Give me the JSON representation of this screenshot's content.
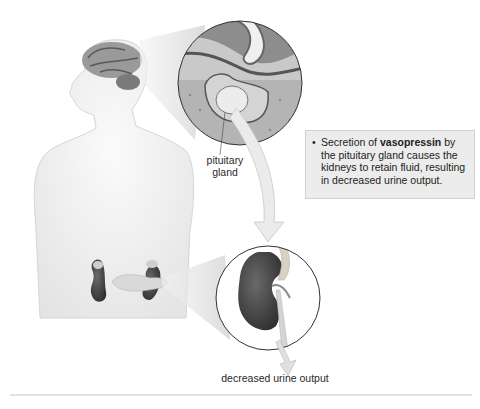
{
  "diagram": {
    "labels": {
      "pituitary": "pituitary\ngland",
      "pituitary_line1": "pituitary",
      "pituitary_line2": "gland",
      "output": "decreased urine output"
    },
    "callout": {
      "bullet": "•",
      "prefix": "Secretion of ",
      "bold": "vasopressin",
      "suffix": " by the pituitary gland causes the kidneys to retain fluid, resulting in decreased urine output."
    },
    "elements": [
      {
        "name": "human-silhouette",
        "description": "light gray upper-body figure facing left"
      },
      {
        "name": "brain",
        "description": "gray brain shown in head"
      },
      {
        "name": "pituitary-magnified-view",
        "description": "circular inset showing pituitary gland"
      },
      {
        "name": "kidneys",
        "description": "pair of dark kidneys with adrenal glands and pancreas"
      },
      {
        "name": "kidney-magnified-view",
        "description": "circular inset showing kidney with ureter"
      },
      {
        "name": "arrow-pituitary-to-kidney",
        "description": "curved light gray arrow"
      },
      {
        "name": "arrow-urine-output",
        "description": "small downward arrow from ureter"
      }
    ],
    "colors": {
      "background": "#ffffff",
      "body": "#f1f1f1",
      "organ_dark": "#4a4a4a",
      "callout_bg": "#ececec"
    }
  }
}
